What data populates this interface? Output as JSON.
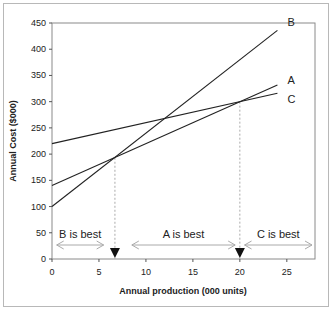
{
  "chart_data": {
    "type": "line",
    "title": "",
    "xlabel": "Annual production (000 units)",
    "ylabel": "Annual Cost ($000)",
    "xlim": [
      0,
      28
    ],
    "ylim": [
      0,
      450
    ],
    "xticks": [
      0,
      5,
      10,
      15,
      20,
      25
    ],
    "yticks": [
      0,
      50,
      100,
      150,
      200,
      250,
      300,
      350,
      400,
      450
    ],
    "grid": false,
    "legend": "inline labels at line ends",
    "series": [
      {
        "name": "A",
        "x": [
          0,
          24
        ],
        "y": [
          140,
          332
        ]
      },
      {
        "name": "B",
        "x": [
          0,
          24
        ],
        "y": [
          100,
          436
        ]
      },
      {
        "name": "C",
        "x": [
          0,
          24
        ],
        "y": [
          220,
          316
        ]
      }
    ],
    "breakeven_points": [
      {
        "x": 6.7,
        "y": 193,
        "between": "A-B"
      },
      {
        "x": 20,
        "y": 300,
        "between": "A-C"
      }
    ],
    "annotations": [
      {
        "text": "B is best",
        "x_from": 0.5,
        "x_to": 5.5
      },
      {
        "text": "A is best",
        "x_from": 8.5,
        "x_to": 19.5
      },
      {
        "text": "C is best",
        "x_from": 20.5,
        "x_to": 28
      }
    ]
  }
}
